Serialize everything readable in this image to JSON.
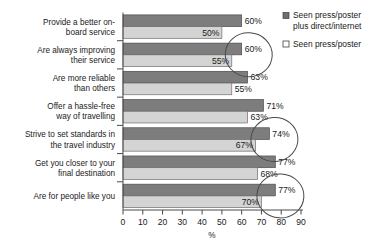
{
  "chart_data": {
    "type": "bar",
    "orientation": "horizontal",
    "title": "",
    "xlabel": "%",
    "ylabel": "",
    "xlim": [
      0,
      90
    ],
    "xticks": [
      0,
      10,
      20,
      30,
      40,
      50,
      60,
      70,
      80,
      90
    ],
    "grid": false,
    "legend_position": "right-top",
    "categories": [
      "Provide a better on-board service",
      "Are always improving their service",
      "Are more reliable than others",
      "Offer a hassle-free way of travelling",
      "Strive to set standards in the travel industry",
      "Get you closer to your final destination",
      "Are for people like you"
    ],
    "category_lines": [
      [
        "Provide a better on-",
        "board service"
      ],
      [
        "Are always improving",
        "their service"
      ],
      [
        "Are more reliable",
        "than others"
      ],
      [
        "Offer a hassle-free",
        "way of travelling"
      ],
      [
        "Strive to set standards in",
        "the travel industry"
      ],
      [
        "Get you closer to your",
        "final destination"
      ],
      [
        "Are for people like you"
      ]
    ],
    "series": [
      {
        "name": "Seen press/poster plus direct/internet",
        "color": "#7d7d7d",
        "values": [
          60,
          60,
          63,
          71,
          74,
          77,
          77
        ],
        "labels": [
          "60%",
          "60%",
          "63%",
          "71%",
          "74%",
          "77%",
          "77%"
        ]
      },
      {
        "name": "Seen press/poster",
        "color": "#d4d4d4",
        "values": [
          50,
          55,
          55,
          63,
          67,
          68,
          70
        ],
        "labels": [
          "50%",
          "55%",
          "55%",
          "63%",
          "67%",
          "68%",
          "70%"
        ]
      }
    ],
    "annotations": [
      {
        "name": "circle-row-2",
        "shape": "circle",
        "encircles": [
          "60%",
          "55%"
        ]
      },
      {
        "name": "circle-row-5",
        "shape": "circle",
        "encircles": [
          "74%",
          "67%"
        ]
      },
      {
        "name": "circle-row-7",
        "shape": "circle",
        "encircles": [
          "77%",
          "70%"
        ]
      }
    ]
  },
  "legend": {
    "items": [
      {
        "label_lines": [
          "Seen press/poster",
          "plus direct/internet"
        ],
        "swatch": "dark"
      },
      {
        "label_lines": [
          "Seen press/poster"
        ],
        "swatch": "light"
      }
    ]
  }
}
